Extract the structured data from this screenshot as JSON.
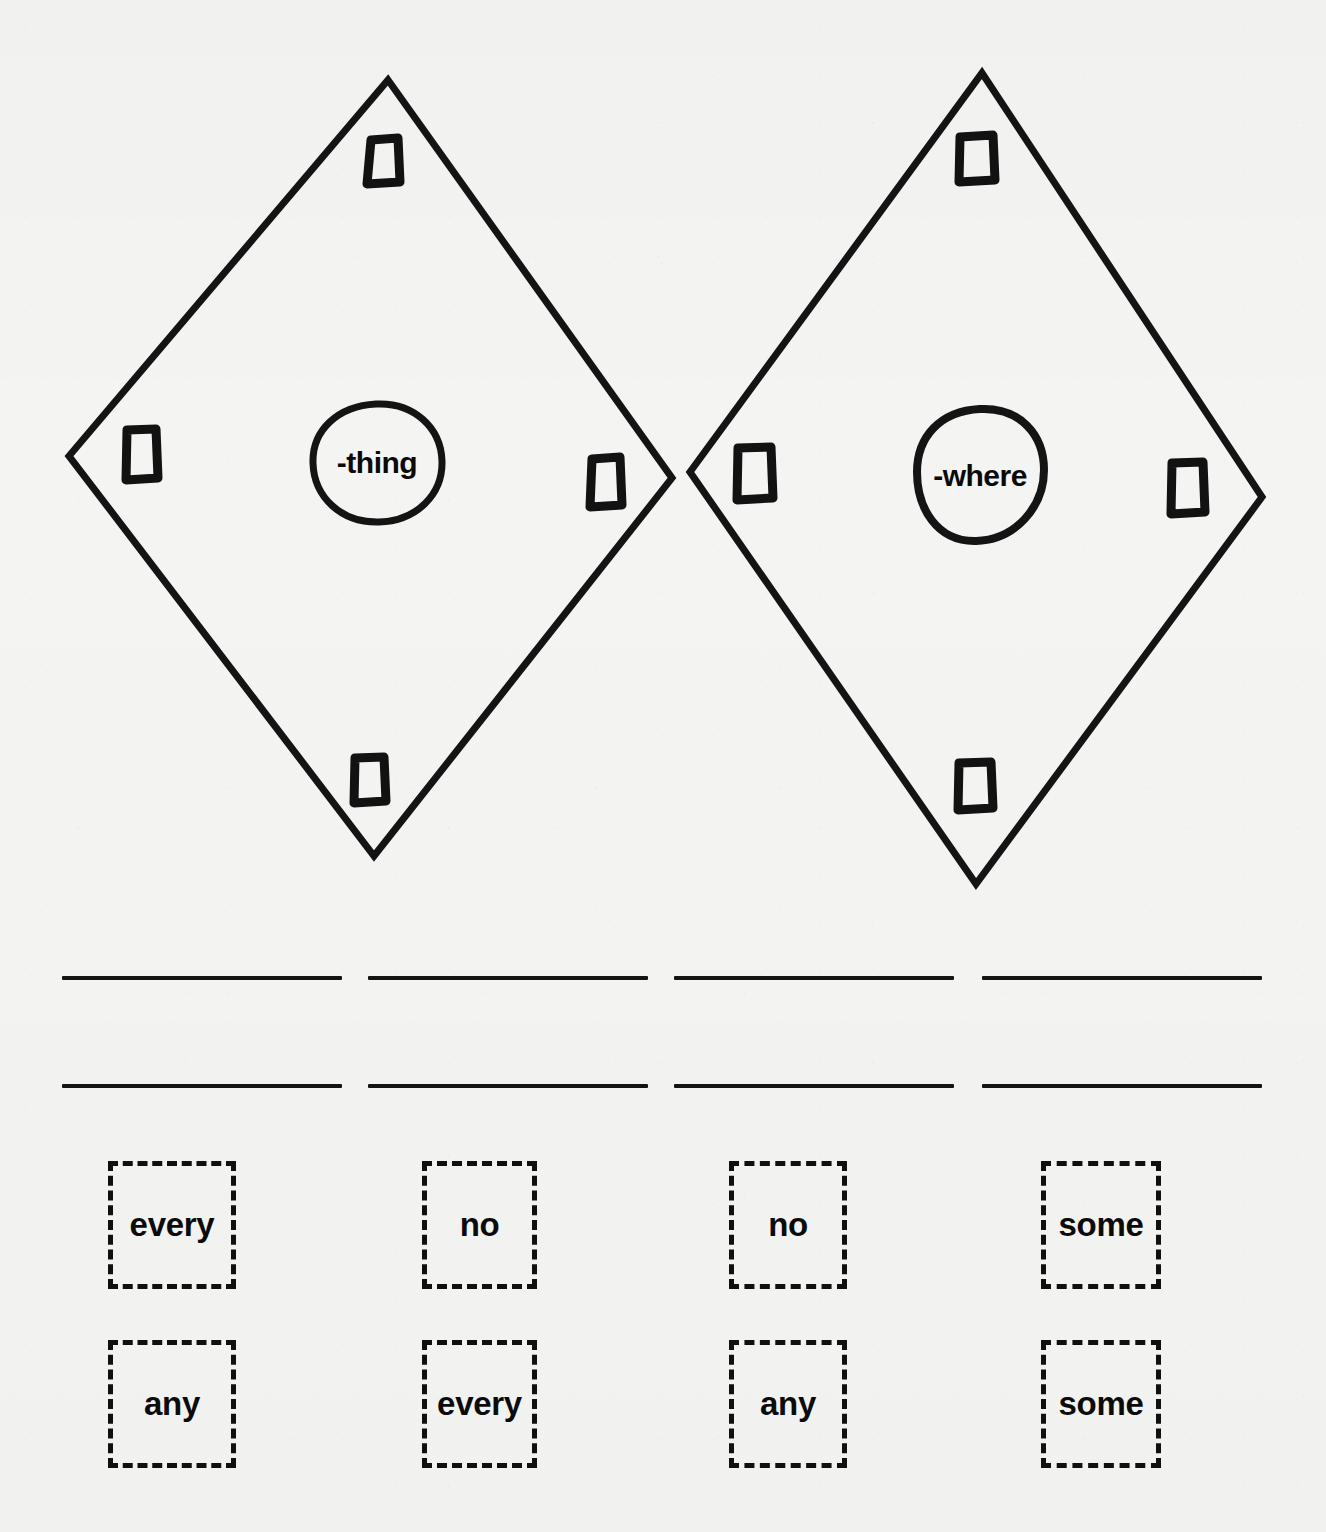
{
  "page": {
    "background_color": "#f4f4f2",
    "ink_color": "#101010"
  },
  "diagrams": [
    {
      "id": "diamond-thing",
      "center_label": "-thing",
      "shape": "diamond",
      "marker_count": 4,
      "markers": [
        "top",
        "left",
        "right",
        "bottom"
      ]
    },
    {
      "id": "diamond-where",
      "center_label": "-where",
      "shape": "diamond",
      "marker_count": 4,
      "markers": [
        "top",
        "left",
        "right",
        "bottom"
      ]
    }
  ],
  "answer_lines": {
    "rows": 2,
    "columns": 4,
    "row_1": [
      "",
      "",
      "",
      ""
    ],
    "row_2": [
      "",
      "",
      "",
      ""
    ]
  },
  "word_bank": {
    "rows": [
      {
        "cells": [
          "every",
          "no",
          "no",
          "some"
        ]
      },
      {
        "cells": [
          "any",
          "every",
          "any",
          "some"
        ]
      }
    ]
  }
}
